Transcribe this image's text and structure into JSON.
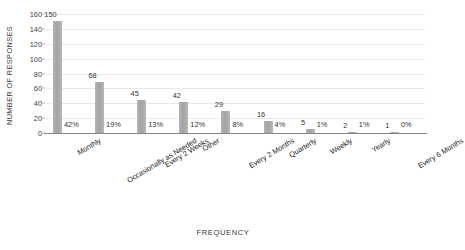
{
  "chart_data": {
    "type": "bar",
    "title": "",
    "xlabel": "FREQUENCY",
    "ylabel": "NUMBER OF RESPONSES",
    "ylim": [
      0,
      160
    ],
    "ytick_step": 20,
    "yticks": [
      "160",
      "140",
      "120",
      "100",
      "80",
      "60",
      "40",
      "20",
      "0"
    ],
    "grid": true,
    "legend": "none",
    "bar_color": "#a6a6a6",
    "categories": [
      "Monthly",
      "Occasionally as Needed",
      "Every 2 Weeks",
      "Other",
      "Every 2 Months",
      "Quarterly",
      "Weekly",
      "Yearly",
      "Every 6 Months"
    ],
    "values": [
      150,
      68,
      45,
      42,
      29,
      16,
      5,
      2,
      1
    ],
    "value_labels": [
      "150",
      "68",
      "45",
      "42",
      "29",
      "16",
      "5",
      "2",
      "1"
    ],
    "percent_labels": [
      "42%",
      "19%",
      "13%",
      "12%",
      "8%",
      "4%",
      "1%",
      "1%",
      "0%"
    ]
  }
}
